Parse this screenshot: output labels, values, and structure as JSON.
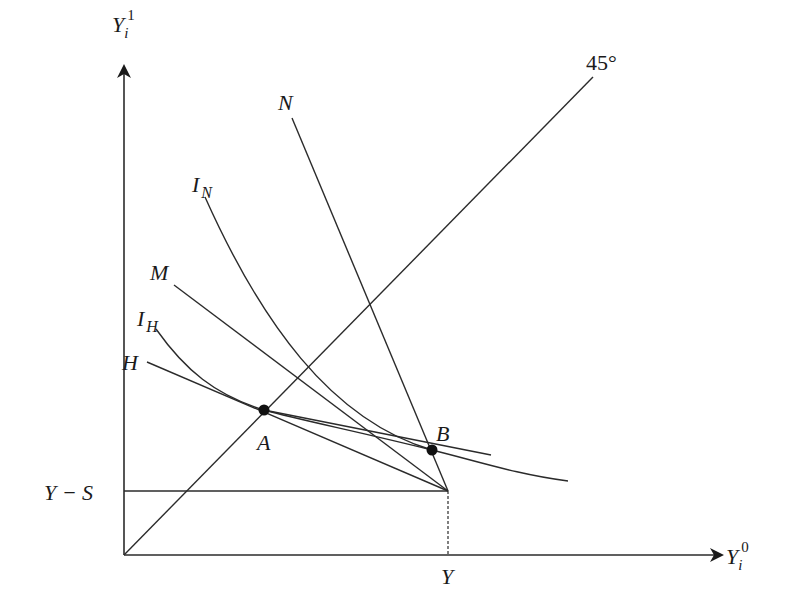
{
  "diagram": {
    "type": "intertemporal-choice-diagram",
    "colors": {
      "line": "#2b2b2b",
      "point": "#111111",
      "background": "#ffffff"
    },
    "axes": {
      "y_axis": {
        "label": "Y",
        "subscript": "i",
        "superscript": "1"
      },
      "x_axis": {
        "label": "Y",
        "subscript": "i",
        "superscript": "0"
      }
    },
    "ticks": {
      "y_tick": "Y − S",
      "x_tick": "Y"
    },
    "reference_line": {
      "label": "45°"
    },
    "lines": [
      {
        "id": "N",
        "label": "N",
        "kind": "budget-line"
      },
      {
        "id": "M",
        "label": "M",
        "kind": "budget-line"
      },
      {
        "id": "H",
        "label": "H",
        "kind": "budget-line"
      }
    ],
    "curves": [
      {
        "id": "IN",
        "label": "I",
        "subscript": "N",
        "kind": "indifference-curve"
      },
      {
        "id": "IH",
        "label": "I",
        "subscript": "H",
        "kind": "indifference-curve"
      }
    ],
    "points": [
      {
        "id": "A",
        "label": "A"
      },
      {
        "id": "B",
        "label": "B"
      }
    ]
  }
}
